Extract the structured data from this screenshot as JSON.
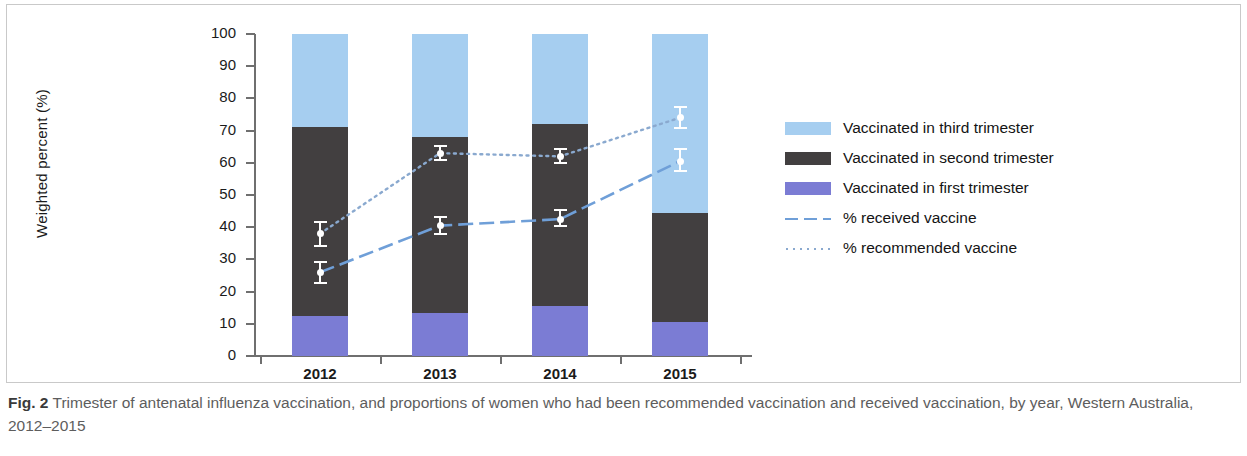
{
  "figure": {
    "label": "Fig. 2",
    "caption": "Trimester of antenatal influenza vaccination, and proportions of women who had been recommended vaccination and received vaccination, by year, Western Australia, 2012–2015"
  },
  "legend": {
    "items": [
      {
        "key": "swatch-light-blue",
        "label": "Vaccinated in third trimester",
        "color": "#a6cef0"
      },
      {
        "key": "swatch-dark-gray",
        "label": "Vaccinated in second trimester",
        "color": "#423f40"
      },
      {
        "key": "swatch-purple",
        "label": "Vaccinated in first trimester",
        "color": "#7b7cd4"
      },
      {
        "key": "line-dashed",
        "label": "% received vaccine",
        "color": "#6f9fd8"
      },
      {
        "key": "line-dotted",
        "label": "% recommended vaccine",
        "color": "#8aa9cf"
      }
    ]
  },
  "axis": {
    "y_title": "Weighted percent (%)",
    "y_ticks": [
      "0",
      "10",
      "20",
      "30",
      "40",
      "50",
      "60",
      "70",
      "80",
      "90",
      "100"
    ],
    "x_ticks": [
      "2012",
      "2013",
      "2014",
      "2015"
    ]
  },
  "chart_data": {
    "type": "bar",
    "title": "Trimester of antenatal influenza vaccination, and proportions of women who had been recommended vaccination and received vaccination, by year, Western Australia, 2012–2015",
    "xlabel": "",
    "ylabel": "Weighted percent (%)",
    "ylim": [
      0,
      100
    ],
    "xlim_categories": [
      "2012",
      "2013",
      "2014",
      "2015"
    ],
    "grid": false,
    "legend_position": "right",
    "stacked": true,
    "categories": [
      "2012",
      "2013",
      "2014",
      "2015"
    ],
    "series": [
      {
        "name": "Vaccinated in first trimester",
        "type": "bar",
        "color": "#7b7cd4",
        "values": [
          12.5,
          13.5,
          15.5,
          10.5
        ]
      },
      {
        "name": "Vaccinated in second trimester",
        "type": "bar",
        "color": "#423f40",
        "values": [
          58.5,
          54.5,
          56.5,
          34.0
        ]
      },
      {
        "name": "Vaccinated in third trimester",
        "type": "bar",
        "color": "#a6cef0",
        "values": [
          29.0,
          32.0,
          28.0,
          55.5
        ]
      }
    ],
    "cumulative_bar_tops": {
      "first_trimester": [
        12.5,
        13.5,
        15.5,
        10.5
      ],
      "second_trimester": [
        71.0,
        68.0,
        72.0,
        44.5
      ],
      "third_trimester": [
        100.0,
        100.0,
        100.0,
        100.0
      ]
    },
    "line_series": [
      {
        "name": "% received vaccine",
        "type": "line",
        "style": "dashed",
        "color": "#6f9fd8",
        "values": [
          26.0,
          40.5,
          42.5,
          60.5
        ],
        "error_low": [
          22.5,
          37.5,
          40.0,
          57.0
        ],
        "error_high": [
          29.5,
          43.5,
          45.5,
          64.5
        ]
      },
      {
        "name": "% recommended vaccine",
        "type": "line",
        "style": "dotted",
        "color": "#8aa9cf",
        "values": [
          38.0,
          63.0,
          62.0,
          74.0
        ],
        "error_low": [
          34.0,
          60.5,
          59.5,
          70.5
        ],
        "error_high": [
          42.0,
          65.5,
          64.5,
          77.5
        ]
      }
    ]
  }
}
